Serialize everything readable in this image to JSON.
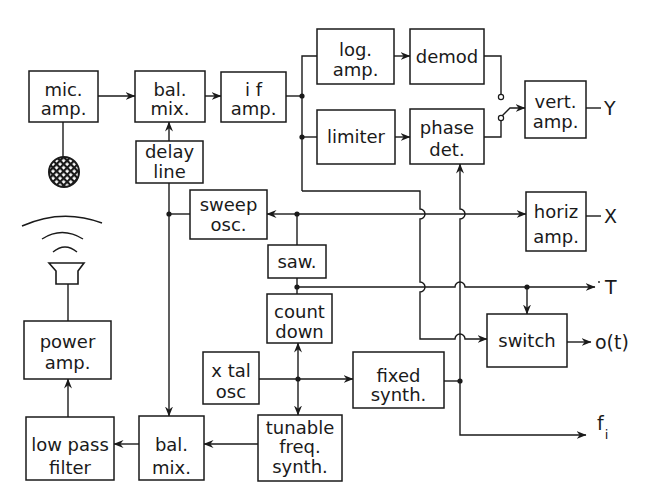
{
  "blocks": {
    "mic_amp": {
      "lines": [
        "mic.",
        "amp."
      ]
    },
    "bal_mix_top": {
      "lines": [
        "bal.",
        "mix."
      ]
    },
    "if_amp": {
      "lines": [
        "i f",
        "amp."
      ]
    },
    "log_amp": {
      "lines": [
        "log.",
        "amp."
      ]
    },
    "demod": {
      "lines": [
        "demod"
      ]
    },
    "limiter": {
      "lines": [
        "limiter"
      ]
    },
    "phase_det": {
      "lines": [
        "phase",
        "det."
      ]
    },
    "vert_amp": {
      "lines": [
        "vert.",
        "amp."
      ]
    },
    "delay_line": {
      "lines": [
        "delay",
        "line"
      ]
    },
    "sweep_osc": {
      "lines": [
        "sweep",
        "osc."
      ]
    },
    "horiz_amp": {
      "lines": [
        "horiz",
        "amp."
      ]
    },
    "saw": {
      "lines": [
        "saw."
      ]
    },
    "count_down": {
      "lines": [
        "count",
        "down"
      ]
    },
    "switch": {
      "lines": [
        "switch"
      ]
    },
    "xtal_osc": {
      "lines": [
        "x tal",
        "osc"
      ]
    },
    "fixed_synth": {
      "lines": [
        "fixed",
        "synth."
      ]
    },
    "tunable_freq_synth": {
      "lines": [
        "tunable",
        "freq.",
        "synth."
      ]
    },
    "power_amp": {
      "lines": [
        "power",
        "amp."
      ]
    },
    "low_pass_filter": {
      "lines": [
        "low pass",
        "filter"
      ]
    },
    "bal_mix_bottom": {
      "lines": [
        "bal.",
        "mix."
      ]
    }
  },
  "outputs": {
    "Y": "Y",
    "X": "X",
    "T": "T",
    "o_t": "o(t)",
    "f_i": {
      "base": "f",
      "subscript": "i"
    }
  },
  "icons": {
    "microphone": "microphone-icon",
    "speaker": "speaker-icon",
    "selector_switch": "switch-contact-icon"
  },
  "connections": [
    {
      "from": "microphone",
      "to": "mic_amp"
    },
    {
      "from": "mic_amp",
      "to": "bal_mix_top"
    },
    {
      "from": "delay_line",
      "to": "bal_mix_top"
    },
    {
      "from": "bal_mix_top",
      "to": "if_amp"
    },
    {
      "from": "if_amp",
      "to": "log_amp"
    },
    {
      "from": "if_amp",
      "to": "limiter"
    },
    {
      "from": "if_amp",
      "to": "switch"
    },
    {
      "from": "log_amp",
      "to": "demod"
    },
    {
      "from": "limiter",
      "to": "phase_det"
    },
    {
      "from": "demod",
      "to": "selector_switch"
    },
    {
      "from": "phase_det",
      "to": "selector_switch"
    },
    {
      "from": "selector_switch",
      "to": "vert_amp"
    },
    {
      "from": "vert_amp",
      "to": "Y"
    },
    {
      "from": "saw",
      "to": "sweep_osc"
    },
    {
      "from": "saw",
      "to": "horiz_amp"
    },
    {
      "from": "horiz_amp",
      "to": "X"
    },
    {
      "from": "sweep_osc",
      "to": "delay_line"
    },
    {
      "from": "sweep_osc",
      "to": "bal_mix_bottom"
    },
    {
      "from": "count_down",
      "to": "T"
    },
    {
      "from": "count_down",
      "to": "switch"
    },
    {
      "from": "switch",
      "to": "o(t)"
    },
    {
      "from": "xtal_osc",
      "to": "count_down"
    },
    {
      "from": "xtal_osc",
      "to": "tunable_freq_synth"
    },
    {
      "from": "xtal_osc",
      "to": "fixed_synth"
    },
    {
      "from": "fixed_synth",
      "to": "phase_det"
    },
    {
      "from": "fixed_synth",
      "to": "f_i"
    },
    {
      "from": "tunable_freq_synth",
      "to": "bal_mix_bottom"
    },
    {
      "from": "bal_mix_bottom",
      "to": "low_pass_filter"
    },
    {
      "from": "low_pass_filter",
      "to": "power_amp"
    },
    {
      "from": "power_amp",
      "to": "speaker"
    }
  ],
  "colors": {
    "line": "#1a1a1a",
    "background": "#ffffff"
  }
}
